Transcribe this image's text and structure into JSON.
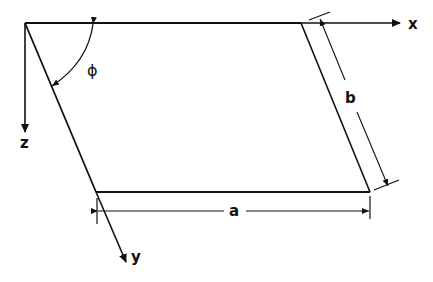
{
  "diagram": {
    "type": "parallelogram-geometry",
    "stroke_color": "#111111",
    "background": "#ffffff",
    "labels": {
      "x_axis": "x",
      "y_axis": "y",
      "z_axis": "z",
      "angle": "ϕ",
      "side_a": "a",
      "side_b": "b"
    },
    "vertices": {
      "top_left": [
        25,
        23
      ],
      "top_right": [
        301,
        23
      ],
      "bottom_right": [
        370,
        192
      ],
      "bottom_left": [
        96,
        192
      ]
    }
  }
}
